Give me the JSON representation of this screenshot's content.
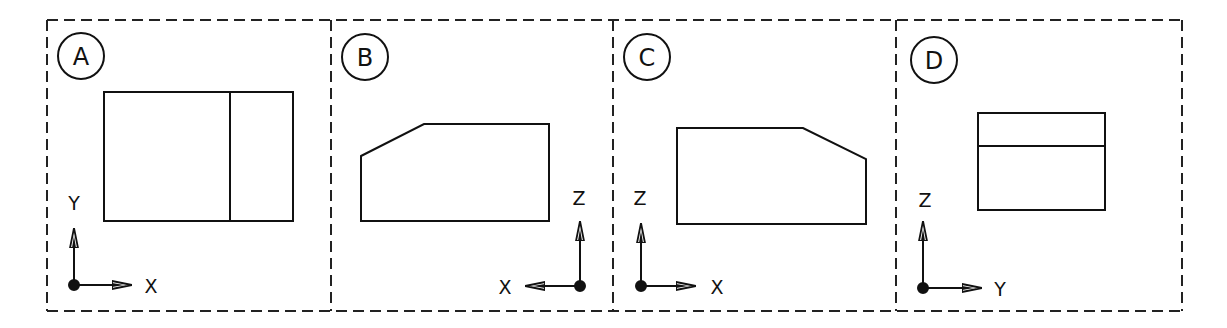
{
  "diagram": {
    "type": "orthographic-views",
    "line_color": "#111111",
    "background": "#ffffff",
    "panels": [
      {
        "id": "A",
        "label": "A",
        "axis_vertical": "Y",
        "axis_horizontal": "X",
        "horizontal_direction": "right",
        "shape": "rectangle with vertical divider near right"
      },
      {
        "id": "B",
        "label": "B",
        "axis_vertical": "Z",
        "axis_horizontal": "X",
        "horizontal_direction": "left",
        "shape": "pentagon with chamfered top-left corner"
      },
      {
        "id": "C",
        "label": "C",
        "axis_vertical": "Z",
        "axis_horizontal": "X",
        "horizontal_direction": "right",
        "shape": "pentagon with chamfered top-right corner"
      },
      {
        "id": "D",
        "label": "D",
        "axis_vertical": "Z",
        "axis_horizontal": "Y",
        "horizontal_direction": "right",
        "shape": "rectangle with horizontal divider near top"
      }
    ]
  }
}
